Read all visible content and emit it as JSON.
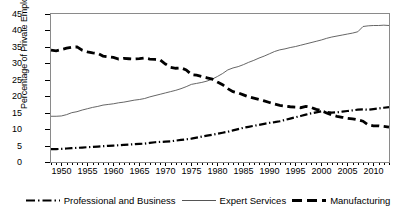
{
  "chart_data": {
    "type": "line",
    "title": "",
    "xlabel": "",
    "ylabel": "Percentage of Private Employment",
    "xlim": [
      1948,
      2013
    ],
    "ylim": [
      0,
      45
    ],
    "ytick_labels": [
      "0",
      "5",
      "10",
      "15",
      "20",
      "25",
      "30",
      "35",
      "40",
      "45"
    ],
    "ytick_values": [
      0,
      5,
      10,
      15,
      20,
      25,
      30,
      35,
      40,
      45
    ],
    "xtick_labels": [
      "1950",
      "1955",
      "1960",
      "1965",
      "1970",
      "1975",
      "1980",
      "1985",
      "1990",
      "1995",
      "2000",
      "2005",
      "2010"
    ],
    "xtick_values": [
      1950,
      1955,
      1960,
      1965,
      1970,
      1975,
      1980,
      1985,
      1990,
      1995,
      2000,
      2005,
      2010
    ],
    "minor_xticks": true,
    "grid": false,
    "legend_position": "bottom",
    "x": [
      1948,
      1949,
      1950,
      1951,
      1952,
      1953,
      1954,
      1955,
      1956,
      1957,
      1958,
      1959,
      1960,
      1961,
      1962,
      1963,
      1964,
      1965,
      1966,
      1967,
      1968,
      1969,
      1970,
      1971,
      1972,
      1973,
      1974,
      1975,
      1976,
      1977,
      1978,
      1979,
      1980,
      1981,
      1982,
      1983,
      1984,
      1985,
      1986,
      1987,
      1988,
      1989,
      1990,
      1991,
      1992,
      1993,
      1994,
      1995,
      1996,
      1997,
      1998,
      1999,
      2000,
      2001,
      2002,
      2003,
      2004,
      2005,
      2006,
      2007,
      2008,
      2009,
      2010,
      2011,
      2012,
      2013
    ],
    "series": [
      {
        "name": "Professional and Business",
        "style": "dash-dot",
        "color": "#000000",
        "width": 2.2,
        "values": [
          3.9,
          3.9,
          4.0,
          4.1,
          4.2,
          4.3,
          4.4,
          4.5,
          4.6,
          4.7,
          4.8,
          4.9,
          5.0,
          5.1,
          5.2,
          5.3,
          5.4,
          5.5,
          5.6,
          5.8,
          6.0,
          6.1,
          6.2,
          6.3,
          6.5,
          6.7,
          6.9,
          7.1,
          7.4,
          7.7,
          8.0,
          8.3,
          8.6,
          8.9,
          9.2,
          9.6,
          10.0,
          10.4,
          10.7,
          11.0,
          11.3,
          11.6,
          11.9,
          12.1,
          12.4,
          12.8,
          13.2,
          13.6,
          14.0,
          14.4,
          14.8,
          15.1,
          15.4,
          15.2,
          15.0,
          15.1,
          15.3,
          15.5,
          15.7,
          15.9,
          16.0,
          15.9,
          16.1,
          16.3,
          16.5,
          16.7
        ]
      },
      {
        "name": "Expert Services",
        "style": "solid",
        "color": "#555555",
        "width": 0.9,
        "values": [
          13.9,
          13.9,
          14.0,
          14.4,
          15.0,
          15.3,
          15.8,
          16.2,
          16.6,
          16.9,
          17.3,
          17.5,
          17.7,
          18.0,
          18.2,
          18.5,
          18.8,
          19.0,
          19.3,
          19.8,
          20.2,
          20.6,
          21.0,
          21.4,
          21.8,
          22.3,
          22.9,
          23.6,
          23.9,
          24.2,
          24.6,
          25.2,
          26.0,
          26.9,
          28.0,
          28.6,
          29.0,
          29.6,
          30.3,
          30.9,
          31.6,
          32.2,
          32.9,
          33.6,
          34.1,
          34.4,
          34.8,
          35.1,
          35.5,
          35.9,
          36.3,
          36.7,
          37.1,
          37.6,
          38.0,
          38.3,
          38.6,
          38.9,
          39.2,
          39.6,
          41.2,
          41.4,
          41.5,
          41.5,
          41.6,
          41.5
        ]
      },
      {
        "name": "Manufacturing",
        "style": "dash",
        "color": "#000000",
        "width": 2.8,
        "values": [
          34.0,
          33.8,
          34.2,
          34.6,
          34.9,
          35.0,
          34.0,
          33.5,
          33.2,
          33.0,
          32.2,
          32.0,
          31.8,
          31.3,
          31.5,
          31.4,
          31.3,
          31.4,
          31.6,
          31.3,
          31.2,
          31.0,
          29.8,
          28.8,
          28.5,
          28.6,
          28.0,
          26.6,
          26.4,
          26.0,
          25.6,
          25.2,
          24.3,
          23.5,
          22.3,
          21.4,
          21.0,
          20.4,
          19.8,
          19.4,
          19.0,
          18.6,
          18.1,
          17.6,
          17.2,
          17.0,
          16.8,
          16.7,
          16.5,
          16.9,
          16.6,
          16.0,
          15.6,
          14.9,
          14.3,
          13.9,
          13.6,
          13.3,
          13.1,
          12.8,
          12.4,
          11.3,
          11.0,
          11.0,
          10.8,
          10.6
        ]
      }
    ]
  },
  "legend": {
    "items": [
      {
        "label": "Professional and Business"
      },
      {
        "label": "Expert Services"
      },
      {
        "label": "Manufacturing"
      }
    ]
  }
}
